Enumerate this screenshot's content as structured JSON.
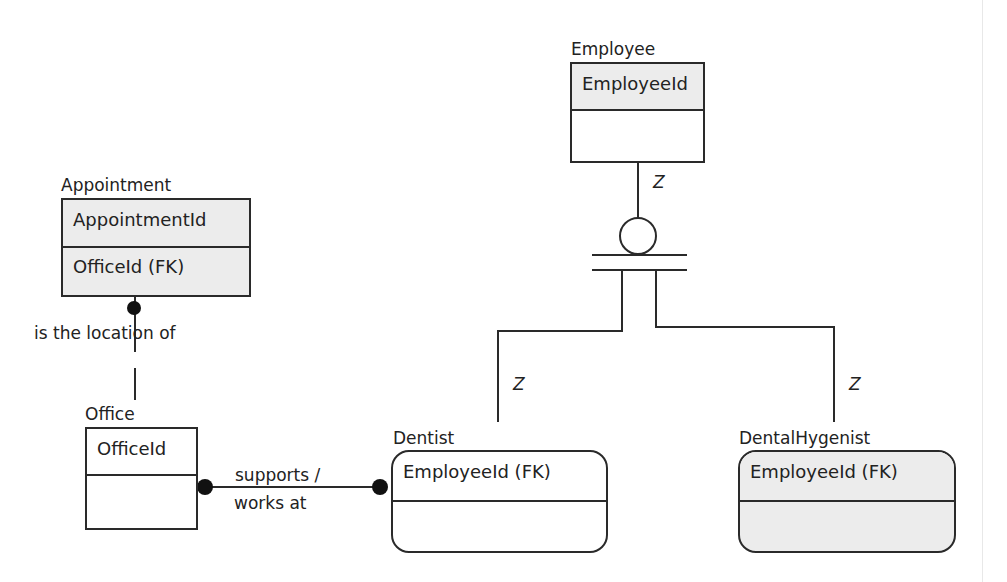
{
  "diagram": {
    "type": "IDEF1X entity-relationship diagram",
    "entities": {
      "employee": {
        "name": "Employee",
        "key": "EmployeeId",
        "attributes": ""
      },
      "appointment": {
        "name": "Appointment",
        "key": "AppointmentId",
        "attributes": "OfficeId (FK)"
      },
      "office": {
        "name": "Office",
        "key": "OfficeId",
        "attributes": ""
      },
      "dentist": {
        "name": "Dentist",
        "key": "EmployeeId (FK)",
        "attributes": ""
      },
      "dental_hygenist": {
        "name": "DentalHygenist",
        "key": "EmployeeId (FK)",
        "attributes": ""
      }
    },
    "relationships": {
      "office_appointment": {
        "label": "is the location of"
      },
      "office_dentist": {
        "label_line1": "supports /",
        "label_line2": "works at"
      }
    },
    "subtype": {
      "cardinality_employee": "Z",
      "cardinality_dentist": "Z",
      "cardinality_hygenist": "Z"
    }
  }
}
